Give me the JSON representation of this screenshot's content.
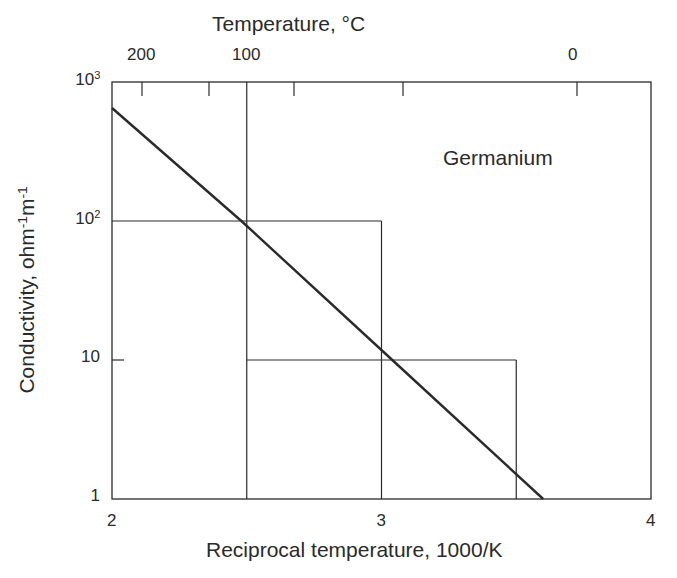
{
  "chart_data": {
    "type": "line",
    "title": "Germanium",
    "xlabel": "Reciprocal temperature, 1000/K",
    "ylabel": "Conductivity, ohm-1m-1",
    "ylabel_parts": {
      "base": "Conductivity, ohm",
      "e1": "-1",
      "mid": "m",
      "e2": "-1"
    },
    "x2label": "Temperature, °C",
    "xlim": [
      2,
      4
    ],
    "ylim": [
      1,
      1000
    ],
    "yscale": "log",
    "x_ticks": [
      "2",
      "3",
      "4"
    ],
    "y_ticks": [
      {
        "base": "1",
        "exp": ""
      },
      {
        "base": "10",
        "exp": ""
      },
      {
        "base": "10",
        "exp": "2"
      },
      {
        "base": "10",
        "exp": "3"
      }
    ],
    "x2_ticks": [
      "200",
      "100",
      "0"
    ],
    "series": [
      {
        "name": "Germanium",
        "x": [
          2.0,
          2.48,
          3.04,
          3.6
        ],
        "y": [
          650,
          100,
          10,
          1
        ]
      }
    ],
    "annotations": [
      {
        "type": "guide",
        "desc": "vertical at 1000/K = 2.5, full height"
      },
      {
        "type": "guide",
        "desc": "horizontal at 100 from 2.0 to 3.0, then vertical down at 3.0"
      },
      {
        "type": "guide",
        "desc": "horizontal at 10 from 2.5 to 3.5, then vertical down at 3.5"
      }
    ],
    "grid": false,
    "legend": "none"
  },
  "colors": {
    "ink": "#2a2a2a",
    "background": "#ffffff"
  }
}
